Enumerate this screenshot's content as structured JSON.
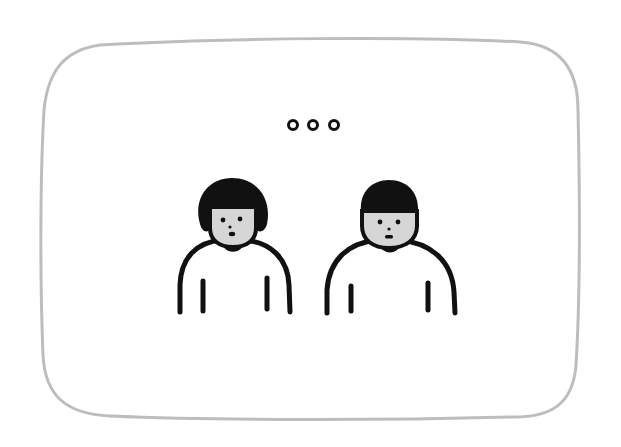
{
  "illustration": {
    "description": "Two simple line-drawn people standing side by side inside a rounded frame, with an ellipsis (three small circles) above them indicating silence or awkward pause.",
    "colors": {
      "background": "#ffffff",
      "frame_stroke": "#bdbdbd",
      "ink": "#111111",
      "face_fill": "#d6d6d6",
      "body_fill": "#ffffff"
    },
    "ellipsis": {
      "label": "...",
      "dot_count": 3
    },
    "figures": [
      {
        "id": "left-person",
        "hair": "bob",
        "expression": "small open mouth"
      },
      {
        "id": "right-person",
        "hair": "short bowl cut",
        "expression": "neutral mouth"
      }
    ]
  }
}
